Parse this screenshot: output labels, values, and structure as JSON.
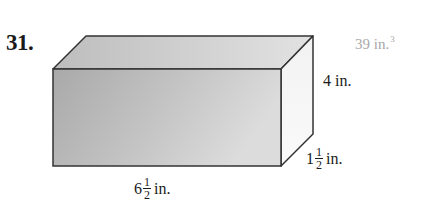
{
  "problem": {
    "number": "31.",
    "answer": {
      "value": "39 in.",
      "exponent": "3"
    },
    "figure": {
      "type": "rectangular prism",
      "dimensions": {
        "height": {
          "text": "4 in."
        },
        "depth": {
          "whole": "1",
          "numerator": "1",
          "denominator": "2",
          "unit": "in."
        },
        "length": {
          "whole": "6",
          "numerator": "1",
          "denominator": "2",
          "unit": "in."
        }
      },
      "colors": {
        "edge": "#333333",
        "front_face": "#b8b8b8",
        "top_face": "#c8c8c8",
        "side_face": "#f0f0f0",
        "answer_text": "#a8a8a8"
      }
    }
  }
}
